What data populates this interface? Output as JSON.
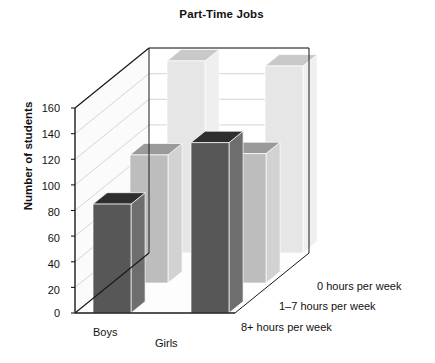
{
  "chart": {
    "title": "Part-Time Jobs",
    "y_axis_label": "Number of students",
    "y_ticks": [
      "0",
      "20",
      "40",
      "60",
      "80",
      "100",
      "120",
      "140",
      "160"
    ],
    "x_labels": [
      "Boys",
      "Girls"
    ],
    "z_labels": [
      "0 hours per week",
      "1–7 hours per week",
      "8+ hours per week"
    ]
  },
  "colors": {
    "front_bar": "#575757",
    "front_bar_top": "#2e2e2e",
    "front_bar_side": "#6e6e6e",
    "mid_bar": "#bdbdbd",
    "mid_bar_top": "#9a9a9a",
    "mid_bar_side": "#d2d2d2",
    "back_bar": "#e6e6e6",
    "back_bar_top": "#c9c9c9",
    "back_bar_side": "#efefef",
    "grid": "#cfcfcf",
    "axis": "#1a1a1a",
    "text": "#111111",
    "panel": "#fbfbfb"
  },
  "chart_data": {
    "type": "bar",
    "title": "Part-Time Jobs",
    "xlabel": "",
    "ylabel": "Number of students",
    "ylim": [
      0,
      160
    ],
    "ytick_values": [
      0,
      20,
      40,
      60,
      80,
      100,
      120,
      140,
      160
    ],
    "grid": true,
    "legend": "none",
    "three_d": true,
    "categories": [
      "Boys",
      "Girls"
    ],
    "depth_categories": [
      "8+ hours per week",
      "1–7 hours per week",
      "0 hours per week"
    ],
    "series": [
      {
        "name": "8+ hours per week",
        "values": [
          85,
          133
        ]
      },
      {
        "name": "1–7 hours per week",
        "values": [
          100,
          101
        ]
      },
      {
        "name": "0 hours per week",
        "values": [
          150,
          146
        ]
      }
    ]
  },
  "geometry": {
    "front_base_y": 313,
    "unit_px": 1.281,
    "depth_dx": 37,
    "depth_dy": -30,
    "bar_width": 38,
    "bar_depth_w": 15,
    "origin_x": 75,
    "group_gap": 60
  }
}
